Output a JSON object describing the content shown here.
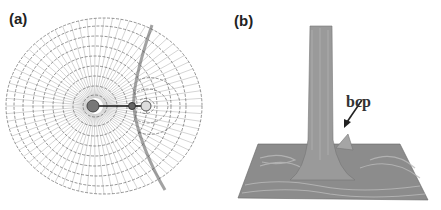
{
  "figure": {
    "panels": [
      {
        "label": "(a)",
        "type": "contour-gradient-map",
        "description": "2D electron density contour plot with gradient paths of a diatomic molecule; two nuclei joined by a bond path with a bond critical point; interatomic surface curving through the map"
      },
      {
        "label": "(b)",
        "type": "3d-relief-plot",
        "annotation": "bcp",
        "description": "3D relief map of electron density showing a tall peak and a small secondary peak near the bond critical point"
      }
    ],
    "colors": {
      "contour": "#555555",
      "gradient_lines": "#999999",
      "surface": "#8a8a8a",
      "background": "#ffffff"
    }
  }
}
